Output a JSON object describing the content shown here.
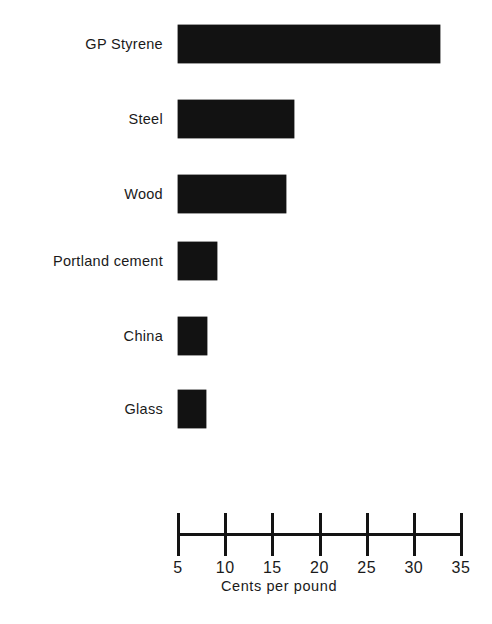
{
  "chart_data": {
    "type": "bar",
    "orientation": "horizontal",
    "title": "",
    "subtitle": "",
    "xlabel": "Cents per pound",
    "ylabel": "",
    "categories": [
      "GP Styrene",
      "Steel",
      "Wood",
      "Portland cement",
      "China",
      "Glass"
    ],
    "values": [
      31.3,
      15.8,
      15.0,
      7.6,
      6.6,
      6.5
    ],
    "series": [
      {
        "name": "Cost",
        "values": [
          31.3,
          15.8,
          15.0,
          7.6,
          6.6,
          6.5
        ]
      }
    ],
    "xlim": [
      5,
      35
    ],
    "xticks": [
      5,
      10,
      15,
      20,
      25,
      30,
      35
    ],
    "xtick_labels": [
      "5",
      "10",
      "15",
      "20",
      "25",
      "30",
      "35"
    ],
    "grid": false,
    "legend": false,
    "legend_position": "none",
    "bar_color": "#121212",
    "background_color": "#ffffff",
    "axis_color": "#131313"
  },
  "axis": {
    "title": "Cents per pound",
    "min": 5,
    "max": 35,
    "ticks": [
      {
        "value": 5,
        "label": "5"
      },
      {
        "value": 10,
        "label": "10"
      },
      {
        "value": 15,
        "label": "15"
      },
      {
        "value": 20,
        "label": "20"
      },
      {
        "value": 25,
        "label": "25"
      },
      {
        "value": 30,
        "label": "30"
      },
      {
        "value": 35,
        "label": "35"
      }
    ]
  },
  "bars": [
    {
      "label": "GP Styrene",
      "value": 31.3
    },
    {
      "label": "Steel",
      "value": 15.8
    },
    {
      "label": "Wood",
      "value": 15.0
    },
    {
      "label": "Portland cement",
      "value": 7.6
    },
    {
      "label": "China",
      "value": 6.6
    },
    {
      "label": "Glass",
      "value": 6.5
    }
  ]
}
